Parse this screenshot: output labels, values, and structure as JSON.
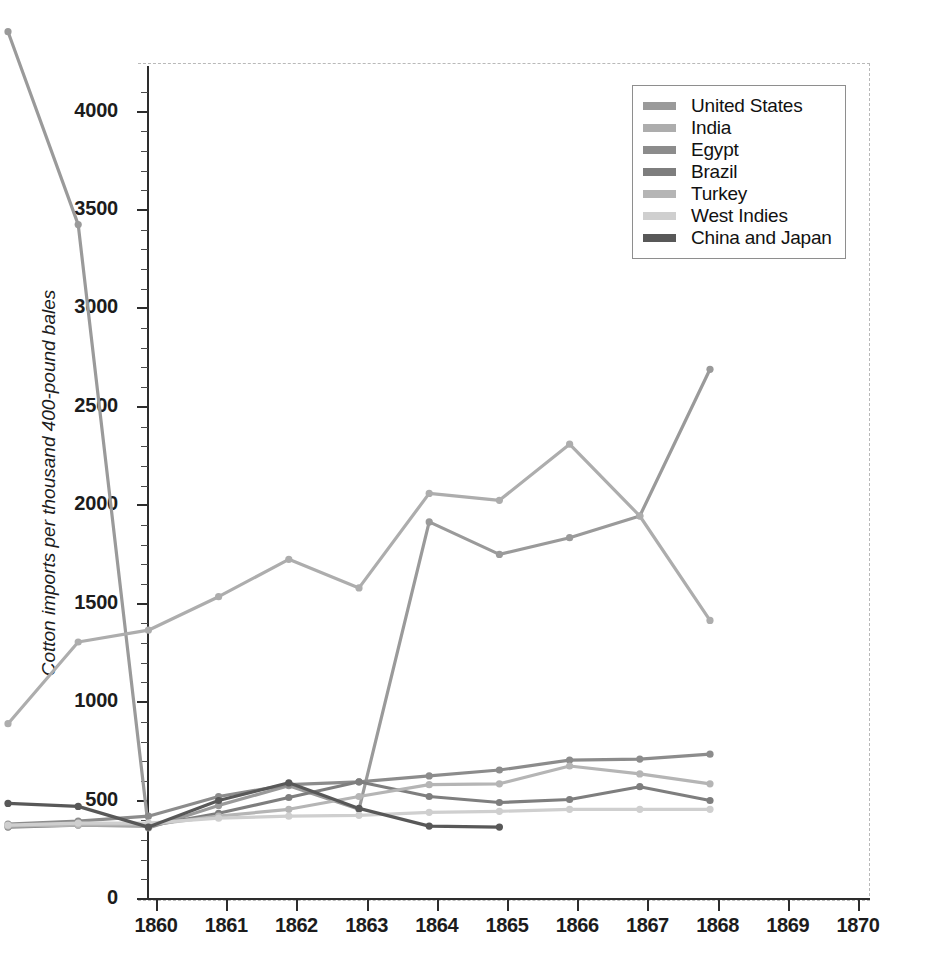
{
  "chart_data": {
    "type": "line",
    "title": "",
    "xlabel": "",
    "ylabel": "Cotton imports per thousand 400-pound bales",
    "x": [
      1860,
      1861,
      1862,
      1863,
      1864,
      1865,
      1866,
      1867,
      1868,
      1869,
      1870
    ],
    "categories": [
      "1860",
      "1861",
      "1862",
      "1863",
      "1864",
      "1865",
      "1866",
      "1867",
      "1868",
      "1869",
      "1870"
    ],
    "xlim": [
      1860,
      1870
    ],
    "ylim": [
      0,
      4150
    ],
    "yticks": [
      0,
      500,
      1000,
      1500,
      2000,
      2500,
      3000,
      3500,
      4000
    ],
    "ytick_labels": [
      "0",
      "500",
      "1000",
      "1500",
      "2000",
      "2500",
      "3000",
      "3500",
      "4000"
    ],
    "minor_tick_interval": 100,
    "grid": false,
    "legend_position": "top-right",
    "series": [
      {
        "name": "United States",
        "color": "#9a9a9a",
        "values": [
          4060,
          3080,
          15,
          130,
          230,
          110,
          1570,
          1405,
          1490,
          1600,
          2345
        ]
      },
      {
        "name": "India",
        "color": "#adadad",
        "values": [
          545,
          960,
          1020,
          1190,
          1380,
          1235,
          1715,
          1680,
          1965,
          1600,
          1070
        ]
      },
      {
        "name": "Egypt",
        "color": "#8c8c8c",
        "values": [
          35,
          50,
          75,
          175,
          235,
          250,
          280,
          310,
          360,
          365,
          390
        ]
      },
      {
        "name": "Brazil",
        "color": "#7e7e7e",
        "values": [
          20,
          30,
          25,
          90,
          170,
          250,
          175,
          145,
          160,
          225,
          155
        ]
      },
      {
        "name": "Turkey",
        "color": "#b5b5b5",
        "values": [
          25,
          30,
          30,
          75,
          110,
          175,
          235,
          240,
          330,
          290,
          240
        ]
      },
      {
        "name": "West Indies",
        "color": "#cfcfcf",
        "values": [
          30,
          40,
          40,
          65,
          75,
          80,
          95,
          100,
          110,
          110,
          110
        ]
      },
      {
        "name": "China and Japan",
        "color": "#585858",
        "values": [
          140,
          125,
          20,
          155,
          245,
          115,
          25,
          20,
          null,
          null,
          null
        ]
      }
    ]
  },
  "legend": {
    "items": [
      {
        "label": "United States",
        "color": "#9a9a9a"
      },
      {
        "label": "India",
        "color": "#adadad"
      },
      {
        "label": "Egypt",
        "color": "#8c8c8c"
      },
      {
        "label": "Brazil",
        "color": "#7e7e7e"
      },
      {
        "label": "Turkey",
        "color": "#b5b5b5"
      },
      {
        "label": "West Indies",
        "color": "#cfcfcf"
      },
      {
        "label": "China and Japan",
        "color": "#585858"
      }
    ]
  },
  "axes": {
    "y_title": "Cotton imports per thousand 400-pound bales",
    "y_labels": [
      "4000",
      "3500",
      "3000",
      "2500",
      "2000",
      "1500",
      "1000",
      "500",
      "0"
    ],
    "x_labels": [
      "1860",
      "1861",
      "1862",
      "1863",
      "1864",
      "1865",
      "1866",
      "1867",
      "1868",
      "1869",
      "1870"
    ]
  }
}
